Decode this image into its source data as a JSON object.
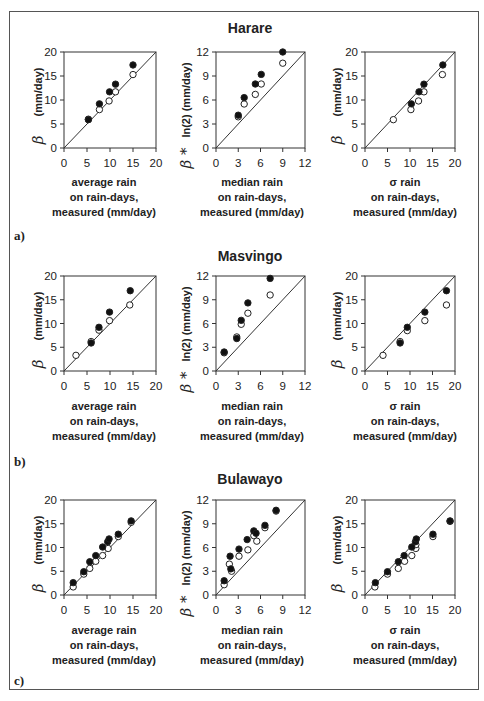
{
  "figure": {
    "panels": [
      {
        "label": "a)",
        "station": "Harare"
      },
      {
        "label": "b)",
        "station": "Masvingo"
      },
      {
        "label": "c)",
        "station": "Bulawayo"
      }
    ],
    "column_xlabels": [
      [
        "average rain",
        "on rain-days,",
        "measured (mm/day)"
      ],
      [
        "median rain",
        "on rain-days,",
        "measured (mm/day)"
      ],
      [
        "σ  rain",
        "on rain-days,",
        "measured (mm/day)"
      ]
    ],
    "column_ylabels": [
      {
        "greek": "β",
        "text": "(mm/day)"
      },
      {
        "greek": "β *",
        "text": "ln(2) (mm/day)"
      },
      {
        "greek": "β",
        "text": "(mm/day)"
      }
    ],
    "legend_note": "Filled circles and open circles: two series per plot; 1:1 line drawn diagonally"
  },
  "chart_data": [
    {
      "type": "scatter",
      "title": "Harare",
      "panel": "a)",
      "xlabel": "average rain on rain-days, measured (mm/day)",
      "ylabel": "β (mm/day)",
      "xlim": [
        0,
        20
      ],
      "ylim": [
        0,
        20
      ],
      "xticks": [
        0,
        5,
        10,
        15,
        20
      ],
      "yticks": [
        0,
        5,
        10,
        15,
        20
      ],
      "diagonal": true,
      "series": [
        {
          "name": "filled",
          "x": [
            5.3,
            7.7,
            9.9,
            11.2,
            15.0
          ],
          "y": [
            5.9,
            9.2,
            11.7,
            13.3,
            17.3
          ]
        },
        {
          "name": "open",
          "x": [
            5.3,
            7.7,
            9.8,
            11.2,
            15.0
          ],
          "y": [
            6.0,
            8.0,
            9.8,
            11.7,
            15.3
          ]
        }
      ]
    },
    {
      "type": "scatter",
      "title": "Harare",
      "panel": "a)",
      "xlabel": "median rain on rain-days, measured (mm/day)",
      "ylabel": "β* ln(2) (mm/day)",
      "xlim": [
        0,
        12
      ],
      "ylim": [
        0,
        12
      ],
      "xticks": [
        0,
        3,
        6,
        9,
        12
      ],
      "yticks": [
        0,
        3,
        6,
        9,
        12
      ],
      "diagonal": true,
      "series": [
        {
          "name": "filled",
          "x": [
            3.0,
            3.8,
            5.3,
            6.1,
            9.0
          ],
          "y": [
            4.1,
            6.3,
            8.0,
            9.2,
            12.0
          ]
        },
        {
          "name": "open",
          "x": [
            3.0,
            3.8,
            5.3,
            6.1,
            9.0
          ],
          "y": [
            3.9,
            5.5,
            6.7,
            8.0,
            10.6
          ]
        }
      ]
    },
    {
      "type": "scatter",
      "title": "Harare",
      "panel": "a)",
      "xlabel": "σ rain on rain-days, measured (mm/day)",
      "ylabel": "β (mm/day)",
      "xlim": [
        0,
        20
      ],
      "ylim": [
        0,
        20
      ],
      "xticks": [
        0,
        5,
        10,
        15,
        20
      ],
      "yticks": [
        0,
        5,
        10,
        15,
        20
      ],
      "diagonal": true,
      "series": [
        {
          "name": "filled",
          "x": [
            10.3,
            12.0,
            13.1,
            17.3
          ],
          "y": [
            9.2,
            11.7,
            13.3,
            17.3
          ]
        },
        {
          "name": "open",
          "x": [
            6.3,
            10.2,
            11.9,
            13.1,
            17.2
          ],
          "y": [
            5.9,
            8.0,
            9.8,
            11.7,
            15.3
          ]
        }
      ]
    },
    {
      "type": "scatter",
      "title": "Masvingo",
      "panel": "b)",
      "xlabel": "average rain on rain-days, measured (mm/day)",
      "ylabel": "β (mm/day)",
      "xlim": [
        0,
        20
      ],
      "ylim": [
        0,
        20
      ],
      "xticks": [
        0,
        5,
        10,
        15,
        20
      ],
      "yticks": [
        0,
        5,
        10,
        15,
        20
      ],
      "diagonal": true,
      "series": [
        {
          "name": "filled",
          "x": [
            5.9,
            7.6,
            9.9,
            14.4
          ],
          "y": [
            5.9,
            9.2,
            12.4,
            16.9
          ]
        },
        {
          "name": "open",
          "x": [
            2.6,
            5.9,
            7.6,
            9.9,
            14.3
          ],
          "y": [
            3.3,
            6.2,
            8.6,
            10.6,
            13.9
          ]
        }
      ]
    },
    {
      "type": "scatter",
      "title": "Masvingo",
      "panel": "b)",
      "xlabel": "median rain on rain-days, measured (mm/day)",
      "ylabel": "β* ln(2) (mm/day)",
      "xlim": [
        0,
        12
      ],
      "ylim": [
        0,
        12
      ],
      "xticks": [
        0,
        3,
        6,
        9,
        12
      ],
      "yticks": [
        0,
        3,
        6,
        9,
        12
      ],
      "diagonal": true,
      "series": [
        {
          "name": "filled",
          "x": [
            1.1,
            2.8,
            3.4,
            4.3,
            7.3
          ],
          "y": [
            2.4,
            4.1,
            6.4,
            8.6,
            11.7
          ]
        },
        {
          "name": "open",
          "x": [
            1.1,
            2.8,
            3.4,
            4.3,
            7.3
          ],
          "y": [
            2.3,
            4.3,
            5.9,
            7.3,
            9.6
          ]
        }
      ]
    },
    {
      "type": "scatter",
      "title": "Masvingo",
      "panel": "b)",
      "xlabel": "σ rain on rain-days, measured (mm/day)",
      "ylabel": "β (mm/day)",
      "xlim": [
        0,
        20
      ],
      "ylim": [
        0,
        20
      ],
      "xticks": [
        0,
        5,
        10,
        15,
        20
      ],
      "yticks": [
        0,
        5,
        10,
        15,
        20
      ],
      "diagonal": true,
      "series": [
        {
          "name": "filled",
          "x": [
            7.8,
            9.4,
            13.3,
            18.1
          ],
          "y": [
            5.9,
            9.2,
            12.4,
            16.9
          ]
        },
        {
          "name": "open",
          "x": [
            4.0,
            7.8,
            9.4,
            13.3,
            18.1
          ],
          "y": [
            3.3,
            6.2,
            8.5,
            10.6,
            13.9
          ]
        }
      ]
    },
    {
      "type": "scatter",
      "title": "Bulawayo",
      "panel": "c)",
      "xlabel": "average rain on rain-days, measured (mm/day)",
      "ylabel": "β mm/day)",
      "xlim": [
        0,
        20
      ],
      "ylim": [
        0,
        20
      ],
      "xticks": [
        0,
        5,
        10,
        15,
        20
      ],
      "yticks": [
        0,
        5,
        10,
        15,
        20
      ],
      "diagonal": true,
      "series": [
        {
          "name": "filled",
          "x": [
            2.0,
            4.3,
            5.6,
            6.9,
            8.4,
            9.5,
            9.8,
            11.8,
            14.6
          ],
          "y": [
            2.6,
            4.9,
            7.0,
            8.3,
            10.1,
            11.2,
            11.8,
            12.8,
            15.6
          ]
        },
        {
          "name": "open",
          "x": [
            2.0,
            4.3,
            5.6,
            6.9,
            8.4,
            9.6,
            11.8,
            14.6
          ],
          "y": [
            1.7,
            4.4,
            5.6,
            7.1,
            8.3,
            9.8,
            12.3,
            15.3
          ]
        }
      ]
    },
    {
      "type": "scatter",
      "title": "Bulawayo",
      "panel": "c)",
      "xlabel": "median rain on rain-days, measured (mm/day)",
      "ylabel": "β* ln(2) (mm/day)",
      "xlim": [
        0,
        12
      ],
      "ylim": [
        0,
        12
      ],
      "xticks": [
        0,
        3,
        6,
        9,
        12
      ],
      "yticks": [
        0,
        3,
        6,
        9,
        12
      ],
      "diagonal": true,
      "series": [
        {
          "name": "filled",
          "x": [
            1.1,
            1.9,
            2.0,
            3.1,
            4.2,
            5.1,
            5.4,
            6.6,
            8.1
          ],
          "y": [
            1.8,
            4.9,
            3.3,
            5.8,
            7.0,
            8.1,
            7.8,
            8.8,
            10.7
          ]
        },
        {
          "name": "open",
          "x": [
            1.1,
            1.8,
            2.1,
            3.1,
            4.3,
            5.1,
            5.5,
            6.6,
            8.1
          ],
          "y": [
            1.3,
            3.9,
            3.0,
            4.9,
            5.7,
            7.5,
            6.8,
            8.5,
            10.6
          ]
        }
      ]
    },
    {
      "type": "scatter",
      "title": "Bulawayo",
      "panel": "c)",
      "xlabel": "σ rain on rain-days, measured (mm/day)",
      "ylabel": "β (mm/day)",
      "xlim": [
        0,
        20
      ],
      "ylim": [
        0,
        20
      ],
      "xticks": [
        0,
        5,
        10,
        15,
        20
      ],
      "yticks": [
        0,
        5,
        10,
        15,
        20
      ],
      "diagonal": true,
      "series": [
        {
          "name": "filled",
          "x": [
            2.3,
            5.0,
            7.4,
            8.7,
            10.4,
            11.2,
            11.4,
            15.1,
            18.9
          ],
          "y": [
            2.6,
            4.9,
            7.0,
            8.3,
            10.1,
            11.2,
            11.8,
            12.8,
            15.6
          ]
        },
        {
          "name": "open",
          "x": [
            2.2,
            5.0,
            7.4,
            8.8,
            10.4,
            11.3,
            11.3,
            15.1,
            18.9
          ],
          "y": [
            1.7,
            4.4,
            5.6,
            7.1,
            8.3,
            9.8,
            10.6,
            12.3,
            15.5
          ]
        }
      ]
    }
  ]
}
